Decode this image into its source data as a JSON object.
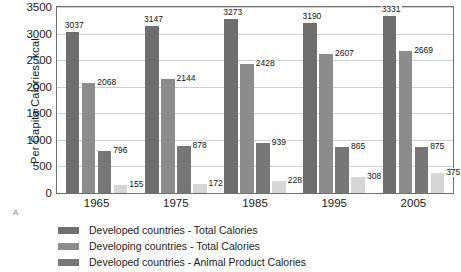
{
  "chart_data": {
    "type": "bar",
    "title": "",
    "subtitle": "",
    "xlabel": "",
    "ylabel": "Per Capita Calories, kcal",
    "categories": [
      "1965",
      "1975",
      "1985",
      "1995",
      "2005"
    ],
    "ylim": [
      0,
      3500
    ],
    "yticks": [
      0,
      500,
      1000,
      1500,
      2000,
      2500,
      3000,
      3500
    ],
    "ytick_labels": [
      "0",
      "500",
      "1000",
      "1500",
      "2000",
      "2500",
      "3000",
      "3500"
    ],
    "grid": true,
    "legend_position": "below",
    "panel_letter": "A",
    "series": [
      {
        "name": "Developed countries - Total Calories",
        "color": "#6e6e6e",
        "values": [
          3037,
          3147,
          3273,
          3190,
          3331
        ]
      },
      {
        "name": "Developing countries - Total Calories",
        "color": "#8c8c8c",
        "values": [
          2068,
          2144,
          2428,
          2607,
          2669
        ]
      },
      {
        "name": "Developed countries - Animal Product Calories",
        "color": "#777777",
        "values": [
          796,
          878,
          939,
          865,
          875
        ]
      },
      {
        "name": "Developing countries - Animal Product Calories",
        "color": "#d6d6d6",
        "values": [
          155,
          172,
          228,
          308,
          375
        ]
      }
    ],
    "data_labels": [
      [
        "3037",
        "2068",
        "796",
        "155"
      ],
      [
        "3147",
        "2144",
        "878",
        "172"
      ],
      [
        "3273",
        "2428",
        "939",
        "228"
      ],
      [
        "3190",
        "2607",
        "865",
        "308"
      ],
      [
        "3331",
        "2669",
        "875",
        "375"
      ]
    ],
    "legend": [
      {
        "label": "Developed countries - Total Calories",
        "color": "#6e6e6e"
      },
      {
        "label": "Developing countries - Total Calories",
        "color": "#8c8c8c"
      },
      {
        "label": "Developed countries - Animal Product Calories",
        "color": "#777777"
      }
    ],
    "axis_color": "#6f6f6f",
    "grid_color": "#cfcfcf"
  }
}
